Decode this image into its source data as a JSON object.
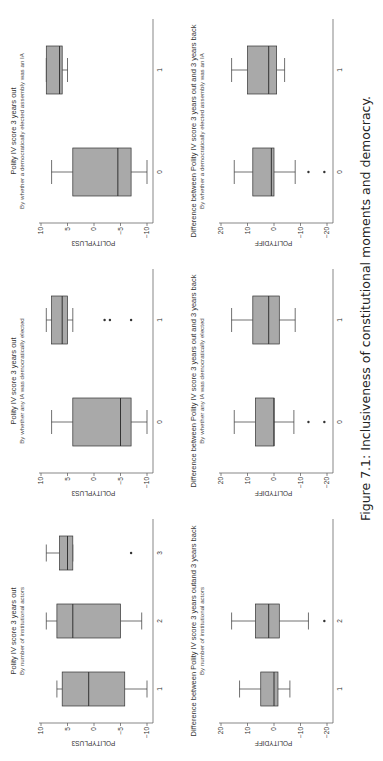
{
  "caption": "Figure 7.1: Inclusiveness of constitutional moments and democracy.",
  "style": {
    "box_fill": "#a9a9a9",
    "line": "#333333",
    "axis": "#555555"
  },
  "chart_data": [
    {
      "type": "box",
      "title": "Polity IV score 3 years out",
      "subtitle": "By number of institutional actors",
      "ylabel": "POLITYPLUS3",
      "ylim": [
        -10,
        10
      ],
      "yticks": [
        -10,
        -5,
        0,
        5,
        10
      ],
      "categories": [
        "1",
        "2",
        "3"
      ],
      "boxes": [
        {
          "cat": "1",
          "whisker_low": -10,
          "q1": -5.8,
          "median": 1,
          "q3": 6,
          "whisker_high": 7,
          "outliers": []
        },
        {
          "cat": "2",
          "whisker_low": -9,
          "q1": -5,
          "median": 4,
          "q3": 7,
          "whisker_high": 9,
          "outliers": []
        },
        {
          "cat": "3",
          "whisker_low": 4,
          "q1": 4,
          "median": 5,
          "q3": 6.5,
          "whisker_high": 9,
          "outliers": [
            -7
          ]
        }
      ]
    },
    {
      "type": "box",
      "title": "Polity IV score 3 years out",
      "subtitle": "By whether any IA was democratically elected",
      "ylabel": "POLITYPLUS3",
      "ylim": [
        -10,
        10
      ],
      "yticks": [
        -10,
        -5,
        0,
        5,
        10
      ],
      "categories": [
        "0",
        "1"
      ],
      "boxes": [
        {
          "cat": "0",
          "whisker_low": -10,
          "q1": -7,
          "median": -5,
          "q3": 4,
          "whisker_high": 8,
          "outliers": []
        },
        {
          "cat": "1",
          "whisker_low": 4,
          "q1": 5,
          "median": 6,
          "q3": 8,
          "whisker_high": 9,
          "outliers": [
            -2,
            -3,
            -7
          ]
        }
      ]
    },
    {
      "type": "box",
      "title": "Polity IV score 3 years out",
      "subtitle": "By whether a democratically elected assembly was an IA",
      "ylabel": "POLITYPLUS3",
      "ylim": [
        -10,
        10
      ],
      "yticks": [
        -10,
        -5,
        0,
        5,
        10
      ],
      "categories": [
        "0",
        "1"
      ],
      "boxes": [
        {
          "cat": "0",
          "whisker_low": -10,
          "q1": -7,
          "median": -4.5,
          "q3": 4,
          "whisker_high": 8,
          "outliers": []
        },
        {
          "cat": "1",
          "whisker_low": 5,
          "q1": 6,
          "median": 6.5,
          "q3": 9,
          "whisker_high": 9,
          "outliers": []
        }
      ]
    },
    {
      "type": "box",
      "title": "Difference between Polity IV score 3 years outand 3 years back",
      "subtitle": "By number of institutional actors",
      "ylabel": "POLITYDIFF",
      "ylim": [
        -20,
        20
      ],
      "yticks": [
        -20,
        -10,
        0,
        10,
        20
      ],
      "categories": [
        "1",
        "2",
        "3"
      ],
      "boxes": [
        {
          "cat": "1",
          "whisker_low": -6,
          "q1": -1.5,
          "median": 0,
          "q3": 5,
          "whisker_high": 13,
          "outliers": []
        },
        {
          "cat": "2",
          "whisker_low": -13,
          "q1": -2,
          "median": 2,
          "q3": 7,
          "whisker_high": 16,
          "outliers": [
            -19
          ]
        }
      ]
    },
    {
      "type": "box",
      "title": "Difference between Polity IV score 3 years out and 3 years back",
      "subtitle": "By whether any IA was democratically elected",
      "ylabel": "POLITYDIFF",
      "ylim": [
        -20,
        20
      ],
      "yticks": [
        -20,
        -10,
        0,
        10,
        20
      ],
      "categories": [
        "0",
        "1"
      ],
      "boxes": [
        {
          "cat": "0",
          "whisker_low": -7.5,
          "q1": 0,
          "median": 0,
          "q3": 7,
          "whisker_high": 15,
          "outliers": [
            -13,
            -19
          ]
        },
        {
          "cat": "1",
          "whisker_low": -8,
          "q1": -2,
          "median": 2,
          "q3": 8,
          "whisker_high": 16,
          "outliers": []
        }
      ]
    },
    {
      "type": "box",
      "title": "Difference between Polity IV score 3 years out and 3 years back",
      "subtitle": "By whether a democratically elected assembly was an IA",
      "ylabel": "POLITYDIFF",
      "ylim": [
        -20,
        20
      ],
      "yticks": [
        -20,
        -10,
        0,
        10,
        20
      ],
      "categories": [
        "0",
        "1"
      ],
      "boxes": [
        {
          "cat": "0",
          "whisker_low": -8,
          "q1": 0,
          "median": 1,
          "q3": 8,
          "whisker_high": 15,
          "outliers": [
            -13,
            -19
          ]
        },
        {
          "cat": "1",
          "whisker_low": -4,
          "q1": -1,
          "median": 2,
          "q3": 10,
          "whisker_high": 16,
          "outliers": []
        }
      ]
    }
  ]
}
